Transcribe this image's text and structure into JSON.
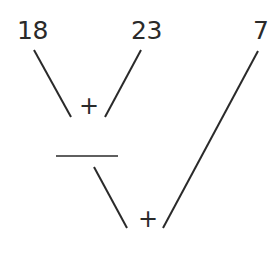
{
  "numbers": {
    "a": "18",
    "b": "23",
    "c": "7"
  },
  "operators": {
    "first": "+",
    "second": "+"
  },
  "answer_blank": "",
  "colors": {
    "ink": "#2a2a2a",
    "background": "#ffffff"
  }
}
